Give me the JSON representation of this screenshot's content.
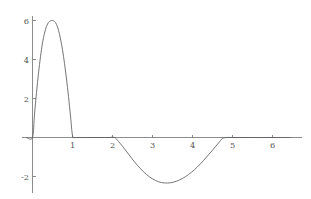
{
  "chart_data": {
    "type": "line",
    "title": "",
    "subtitle": "",
    "xlabel": "",
    "ylabel": "",
    "xlim": [
      -0.2,
      6.5
    ],
    "ylim": [
      -2.9,
      6.6
    ],
    "grid": false,
    "legend": null,
    "xticks": [
      1,
      2,
      3,
      4,
      5,
      6
    ],
    "xticklabels": [
      "1",
      "2",
      "3",
      "4",
      "5",
      "6"
    ],
    "yticks": [
      -2,
      2,
      4,
      6
    ],
    "yticklabels": [
      "-2",
      "2",
      "4",
      "6"
    ],
    "annotations": [],
    "series": [
      {
        "name": "f(x)",
        "color": "#5c5c5c",
        "x": [
          -0.15,
          0.0,
          0.05,
          0.1,
          0.15,
          0.2,
          0.25,
          0.3,
          0.35,
          0.4,
          0.45,
          0.5,
          0.55,
          0.6,
          0.65,
          0.7,
          0.75,
          0.8,
          0.85,
          0.9,
          0.95,
          1.0,
          1.05,
          1.1,
          1.3,
          1.5,
          1.7,
          1.9,
          2.05,
          2.15,
          2.25,
          2.4,
          2.55,
          2.7,
          2.85,
          3.0,
          3.15,
          3.3,
          3.45,
          3.6,
          3.75,
          3.9,
          4.05,
          4.2,
          4.35,
          4.5,
          4.65,
          4.75,
          4.85,
          5.0,
          5.3,
          5.7,
          6.1,
          6.45
        ],
        "y": [
          0.0,
          0.0,
          1.2,
          2.3,
          3.3,
          4.15,
          4.85,
          5.35,
          5.7,
          5.9,
          5.98,
          6.0,
          5.95,
          5.8,
          5.5,
          5.05,
          4.5,
          3.8,
          3.0,
          2.1,
          1.1,
          0.1,
          0.0,
          0.0,
          0.0,
          0.0,
          0.0,
          0.0,
          0.0,
          -0.2,
          -0.45,
          -0.85,
          -1.25,
          -1.6,
          -1.9,
          -2.12,
          -2.27,
          -2.33,
          -2.32,
          -2.24,
          -2.1,
          -1.9,
          -1.65,
          -1.35,
          -1.0,
          -0.65,
          -0.28,
          -0.05,
          0.0,
          0.0,
          0.0,
          0.0,
          0.0,
          0.0
        ]
      }
    ]
  },
  "figure": {
    "background_color": "#ffffff",
    "axis_color": "#6f6f6f",
    "curve_color": "#5c5c5c",
    "tick_label_color": "#555555"
  }
}
